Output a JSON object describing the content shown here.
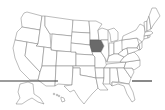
{
  "map": {
    "title": "United States",
    "highlighted_state": "Iowa",
    "colors": {
      "highlight": "#6a6a6a",
      "default_fill": "#ffffff",
      "border": "#7a7a7a",
      "rule": "#3a3a3a"
    },
    "states": [
      "Washington",
      "Oregon",
      "California",
      "Idaho",
      "Nevada",
      "Montana",
      "Wyoming",
      "Utah",
      "Arizona",
      "Colorado",
      "New Mexico",
      "North Dakota",
      "South Dakota",
      "Nebraska",
      "Kansas",
      "Oklahoma",
      "Texas",
      "Minnesota",
      "Iowa",
      "Missouri",
      "Arkansas",
      "Louisiana",
      "Wisconsin",
      "Illinois",
      "Michigan",
      "Indiana",
      "Ohio",
      "Kentucky",
      "Tennessee",
      "Mississippi",
      "Alabama",
      "Georgia",
      "Florida",
      "South Carolina",
      "North Carolina",
      "Virginia",
      "West Virginia",
      "Pennsylvania",
      "New York",
      "Maryland",
      "Delaware",
      "New Jersey",
      "Connecticut",
      "Rhode Island",
      "Massachusetts",
      "Vermont",
      "New Hampshire",
      "Maine",
      "Alaska",
      "Hawaii"
    ]
  }
}
